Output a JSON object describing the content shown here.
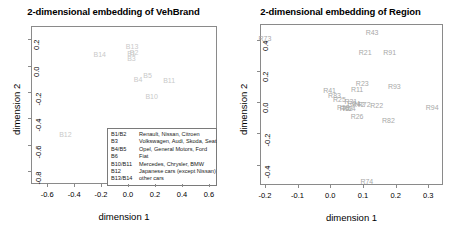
{
  "chart_data": [
    {
      "type": "scatter",
      "title": "2-dimensional embedding of VehBrand",
      "xlabel": "dimension 1",
      "ylabel": "dimension 2",
      "xlim": [
        -0.72,
        0.66
      ],
      "ylim": [
        -0.9,
        0.3
      ],
      "xticks": [
        "-0.6",
        "-0.4",
        "-0.2",
        "0.0",
        "0.2",
        "0.4",
        "0.6"
      ],
      "xtickvals": [
        -0.6,
        -0.4,
        -0.2,
        0.0,
        0.2,
        0.4,
        0.6
      ],
      "yticks": [
        "0.2",
        "0.0",
        "-0.2",
        "-0.4",
        "-0.6",
        "-0.8"
      ],
      "ytickvals": [
        0.2,
        0.0,
        -0.2,
        -0.4,
        -0.6,
        -0.8
      ],
      "grid": false,
      "legend_position": "bottom-right",
      "points": [
        {
          "label": "B13",
          "x": 0.03,
          "y": 0.145
        },
        {
          "label": "B14",
          "x": -0.21,
          "y": 0.085
        },
        {
          "label": "B1",
          "x": 0.025,
          "y": 0.095
        },
        {
          "label": "B2",
          "x": 0.045,
          "y": 0.1
        },
        {
          "label": "B3",
          "x": 0.025,
          "y": 0.055
        },
        {
          "label": "B4",
          "x": 0.075,
          "y": -0.105
        },
        {
          "label": "B5",
          "x": 0.145,
          "y": -0.07
        },
        {
          "label": "B11",
          "x": 0.305,
          "y": -0.11
        },
        {
          "label": "B10",
          "x": 0.175,
          "y": -0.23
        },
        {
          "label": "B12",
          "x": -0.465,
          "y": -0.52
        }
      ],
      "legend": [
        {
          "key": "B1/B2",
          "desc": "Renault, Nissan, Citroen"
        },
        {
          "key": "B3",
          "desc": "Volkswagen, Audi, Skoda, Seat"
        },
        {
          "key": "B4/B5",
          "desc": "Opel, General Motors, Ford"
        },
        {
          "key": "B6",
          "desc": "Fiat"
        },
        {
          "key": "B10/B11",
          "desc": "Mercedes, Chrysler, BMW"
        },
        {
          "key": "B12",
          "desc": "Japanese cars (except Nissan)"
        },
        {
          "key": "B13/B14",
          "desc": "other cars"
        }
      ]
    },
    {
      "type": "scatter",
      "title": "2-dimensional embedding of Region",
      "xlabel": "dimension 1",
      "ylabel": "dimension 2",
      "xlim": [
        -0.215,
        0.345
      ],
      "ylim": [
        -0.53,
        0.5
      ],
      "xticks": [
        "-0.2",
        "-0.1",
        "0.0",
        "0.1",
        "0.2",
        "0.3"
      ],
      "xtickvals": [
        -0.2,
        -0.1,
        0.0,
        0.1,
        0.2,
        0.3
      ],
      "yticks": [
        "0.4",
        "0.2",
        "0.0",
        "-0.2",
        "-0.4"
      ],
      "ytickvals": [
        0.4,
        0.2,
        0.0,
        -0.2,
        -0.4
      ],
      "grid": false,
      "legend_position": "none",
      "points": [
        {
          "label": "R43",
          "x": 0.128,
          "y": 0.452
        },
        {
          "label": "R73",
          "x": -0.2,
          "y": 0.408
        },
        {
          "label": "R21",
          "x": 0.107,
          "y": 0.318
        },
        {
          "label": "R91",
          "x": 0.182,
          "y": 0.318
        },
        {
          "label": "R23",
          "x": 0.098,
          "y": 0.12
        },
        {
          "label": "R93",
          "x": 0.196,
          "y": 0.105
        },
        {
          "label": "R11",
          "x": 0.082,
          "y": 0.082
        },
        {
          "label": "R41",
          "x": -0.002,
          "y": 0.075
        },
        {
          "label": "R83",
          "x": 0.013,
          "y": 0.045
        },
        {
          "label": "R25",
          "x": 0.028,
          "y": 0.018
        },
        {
          "label": "R31",
          "x": 0.063,
          "y": 0.01
        },
        {
          "label": "R24",
          "x": 0.072,
          "y": -0.005
        },
        {
          "label": "R42",
          "x": 0.086,
          "y": -0.01
        },
        {
          "label": "R72",
          "x": 0.104,
          "y": -0.012
        },
        {
          "label": "R22",
          "x": 0.142,
          "y": -0.015
        },
        {
          "label": "R53",
          "x": 0.04,
          "y": -0.032
        },
        {
          "label": "R52",
          "x": 0.049,
          "y": -0.035
        },
        {
          "label": "R54",
          "x": 0.058,
          "y": -0.035
        },
        {
          "label": "R94",
          "x": 0.312,
          "y": -0.032
        },
        {
          "label": "R26",
          "x": 0.082,
          "y": -0.088
        },
        {
          "label": "R82",
          "x": 0.178,
          "y": -0.115
        },
        {
          "label": "R74",
          "x": 0.112,
          "y": -0.502
        }
      ]
    }
  ]
}
